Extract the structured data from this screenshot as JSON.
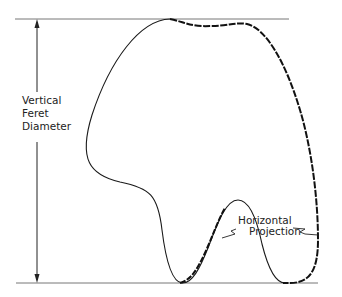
{
  "diagram": {
    "type": "feret-diameter-illustration",
    "labels": {
      "vertical_line1": "Vertical",
      "vertical_line2": "Feret",
      "vertical_line3": "Diameter",
      "horizontal_line1": "Horizontal",
      "horizontal_line2": "Projection"
    },
    "colors": {
      "outline": "#1a1a1a",
      "reference_lines": "#777777",
      "background": "#ffffff"
    },
    "elements": [
      "top-tangent-line",
      "bottom-tangent-line",
      "vertical-double-arrow",
      "particle-outline",
      "horizontal-projection-dashed-segment",
      "leader-lines"
    ]
  }
}
